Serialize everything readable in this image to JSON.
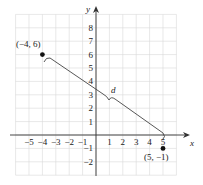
{
  "diagram": {
    "type": "coordinate-plane",
    "axes": {
      "x_label": "x",
      "y_label": "y"
    },
    "x_ticks": [
      "−5",
      "−4",
      "−3",
      "−2",
      "−1",
      "1",
      "2",
      "3",
      "4",
      "5"
    ],
    "y_ticks": [
      "8",
      "7",
      "6",
      "5",
      "4",
      "3",
      "2",
      "1",
      "−1",
      "−2"
    ],
    "points": [
      {
        "label": "(−4, 6)",
        "x": -4,
        "y": 6
      },
      {
        "label": "(5, −1)",
        "x": 5,
        "y": -1
      }
    ],
    "segment_label": "d",
    "colors": {
      "grid": "#d9d9d9",
      "axis": "#333333",
      "line": "#444444",
      "point": "#111111"
    }
  }
}
